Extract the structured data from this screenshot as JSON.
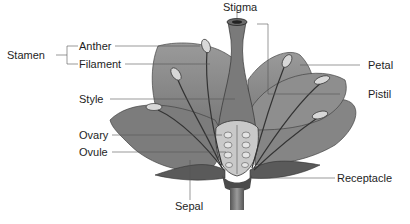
{
  "diagram": {
    "labels": {
      "stigma": "Stigma",
      "stamen": "Stamen",
      "anther": "Anther",
      "filament": "Filament",
      "style": "Style",
      "ovary": "Ovary",
      "ovule": "Ovule",
      "sepal": "Sepal",
      "petal": "Petal",
      "pistil": "Pistil",
      "receptacle": "Receptacle"
    },
    "colors": {
      "petal_fill": "#8a8a8a",
      "petal_dark": "#5c5c5c",
      "pistil_fill": "#7a7a7a",
      "anther_fill": "#d8d8d8",
      "ovary_fill": "#c9c9c9",
      "leader_line": "#555555",
      "text": "#1e1e1e"
    }
  }
}
